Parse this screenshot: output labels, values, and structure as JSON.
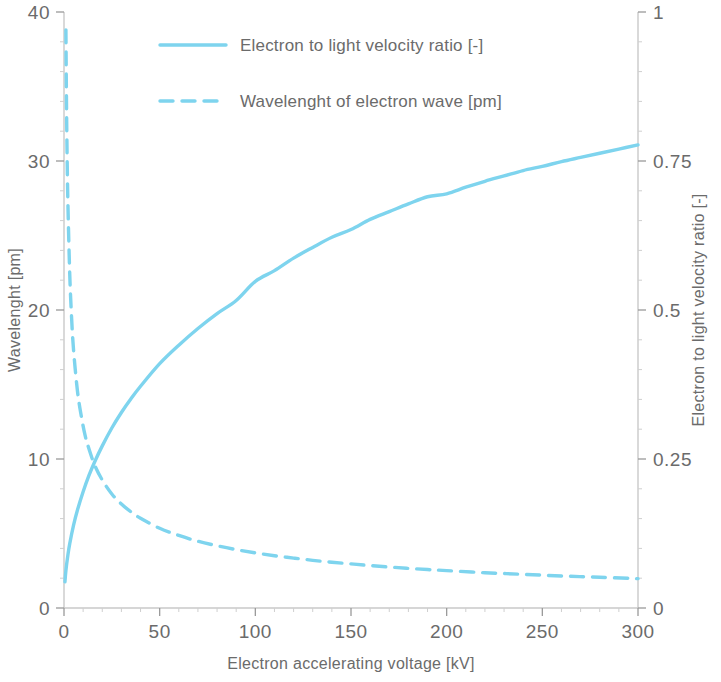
{
  "chart_data": {
    "type": "line",
    "title": "",
    "subtitle": "",
    "xlabel": "Electron accelerating voltage [kV]",
    "ylabel": "Wavelenght [pm]",
    "y2label": "Electron to light velocity ratio [-]",
    "xlim": [
      0,
      300
    ],
    "ylim": [
      0,
      40
    ],
    "y2lim": [
      0,
      1
    ],
    "xticks": [
      "0",
      "50",
      "100",
      "150",
      "200",
      "250",
      "300"
    ],
    "xtick_values": [
      0,
      50,
      100,
      150,
      200,
      250,
      300
    ],
    "yticks": [
      "0",
      "10",
      "20",
      "30",
      "40"
    ],
    "ytick_values": [
      0,
      10,
      20,
      30,
      40
    ],
    "y2ticks": [
      "0",
      "0.25",
      "0.5",
      "0.75",
      "1"
    ],
    "y2tick_values": [
      0,
      0.25,
      0.5,
      0.75,
      1
    ],
    "grid": false,
    "legend_position": "top-center",
    "accent_color": "#7ed4ee",
    "axis_color": "#c9c9c9",
    "text_color": "#6b6b6b",
    "background": "#ffffff",
    "series": [
      {
        "name": "Electron to light velocity ratio [-]",
        "axis": "right",
        "style": "solid",
        "color": "#7ed4ee",
        "x": [
          0.5,
          1,
          2,
          3,
          5,
          7,
          10,
          13,
          16,
          20,
          25,
          30,
          35,
          40,
          50,
          60,
          70,
          80,
          90,
          100,
          110,
          120,
          130,
          140,
          150,
          160,
          170,
          180,
          190,
          200,
          210,
          220,
          230,
          240,
          250,
          260,
          270,
          280,
          290,
          300
        ],
        "y": [
          0.044,
          0.063,
          0.088,
          0.108,
          0.139,
          0.164,
          0.195,
          0.222,
          0.245,
          0.272,
          0.302,
          0.328,
          0.351,
          0.372,
          0.41,
          0.441,
          0.469,
          0.494,
          0.516,
          0.548,
          0.566,
          0.587,
          0.605,
          0.622,
          0.635,
          0.652,
          0.665,
          0.678,
          0.69,
          0.695,
          0.706,
          0.716,
          0.725,
          0.734,
          0.741,
          0.749,
          0.756,
          0.763,
          0.77,
          0.777
        ]
      },
      {
        "name": "Wavelenght of electron wave [pm]",
        "axis": "left",
        "style": "dashed",
        "color": "#7ed4ee",
        "x": [
          1,
          1.2,
          1.5,
          2,
          3,
          4,
          5,
          7,
          9,
          11,
          13,
          16,
          20,
          25,
          30,
          35,
          40,
          50,
          60,
          70,
          80,
          90,
          100,
          110,
          120,
          130,
          140,
          150,
          160,
          170,
          180,
          190,
          200,
          220,
          240,
          260,
          280,
          300
        ],
        "y": [
          38.8,
          35.4,
          31.6,
          27.4,
          22.4,
          19.4,
          17.3,
          14.6,
          12.9,
          11.6,
          10.7,
          9.6,
          8.59,
          7.65,
          6.98,
          6.45,
          6.02,
          5.35,
          4.87,
          4.48,
          4.18,
          3.92,
          3.7,
          3.51,
          3.35,
          3.2,
          3.07,
          2.96,
          2.85,
          2.75,
          2.66,
          2.58,
          2.51,
          2.37,
          2.26,
          2.15,
          2.06,
          1.97
        ]
      }
    ]
  },
  "legend": {
    "items": [
      {
        "label": "Electron to light velocity ratio [-]",
        "style": "solid"
      },
      {
        "label": "Wavelenght of electron wave [pm]",
        "style": "dashed"
      }
    ]
  },
  "axes": {
    "left_title": "Wavelenght [pm]",
    "right_title": "Electron to light velocity ratio [-]",
    "bottom_title": "Electron accelerating voltage [kV]"
  }
}
